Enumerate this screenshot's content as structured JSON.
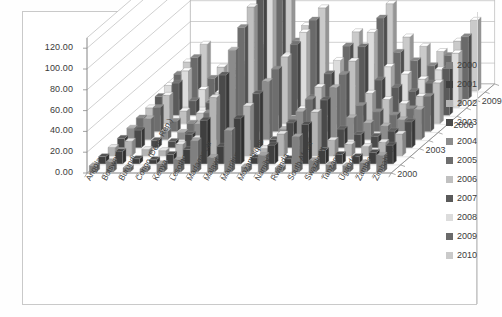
{
  "frame": {
    "border_color": "#c9c9c9",
    "background": "#ffffff"
  },
  "axes": {
    "y_ticks": [
      "120.00",
      "100.00",
      "80.00",
      "60.00",
      "40.00",
      "20.00",
      "0.00"
    ],
    "depth_ticks": [
      "2009",
      "2006",
      "2003",
      "2000"
    ]
  },
  "legend": {
    "position": "right",
    "entries": [
      {
        "label": "2000",
        "color": "#808080"
      },
      {
        "label": "2001",
        "color": "#3f3f3f"
      },
      {
        "label": "2002",
        "color": "#b4b4b4"
      },
      {
        "label": "2003",
        "color": "#4a4a4a"
      },
      {
        "label": "2004",
        "color": "#8c8c8c"
      },
      {
        "label": "2005",
        "color": "#6e6e6e"
      },
      {
        "label": "2006",
        "color": "#c0c0c0"
      },
      {
        "label": "2007",
        "color": "#5a5a5a"
      },
      {
        "label": "2008",
        "color": "#dcdcdc"
      },
      {
        "label": "2009",
        "color": "#6a6a6a"
      },
      {
        "label": "2010",
        "color": "#cacaca"
      }
    ]
  },
  "chart_data": {
    "type": "bar",
    "title": "",
    "subtitle": "",
    "xlabel": "",
    "ylabel": "",
    "zlabel": "",
    "render": "3d-grouped-bar",
    "grid": true,
    "ylim": [
      0,
      120
    ],
    "ytick_step": 20,
    "categories": [
      "Angola",
      "Botswana",
      "Burundi",
      "Congo (Dem. Rep.)",
      "Kenya",
      "Lesotho",
      "Madagascar",
      "Malawi",
      "Mauritius",
      "Mozambique",
      "Namibia",
      "Rwanda",
      "South Africa",
      "Swaziland",
      "Tanzania",
      "Uganda",
      "Zambia",
      "Zimbabwe"
    ],
    "depth_axis": [
      "2000",
      "2003",
      "2006",
      "2009"
    ],
    "series": [
      {
        "name": "2000",
        "values": [
          6,
          10,
          4,
          3,
          8,
          12,
          30,
          14,
          40,
          5,
          16,
          4,
          34,
          11,
          7,
          6,
          9,
          16
        ]
      },
      {
        "name": "2001",
        "values": [
          7,
          12,
          5,
          4,
          9,
          14,
          42,
          17,
          44,
          6,
          18,
          5,
          38,
          13,
          9,
          7,
          11,
          18
        ]
      },
      {
        "name": "2002",
        "values": [
          8,
          14,
          6,
          5,
          11,
          17,
          56,
          20,
          48,
          7,
          21,
          6,
          42,
          15,
          11,
          9,
          13,
          21
        ]
      },
      {
        "name": "2003",
        "values": [
          9,
          17,
          7,
          6,
          13,
          20,
          70,
          24,
          52,
          8,
          24,
          7,
          46,
          18,
          13,
          11,
          16,
          25
        ]
      },
      {
        "name": "2004",
        "values": [
          11,
          20,
          8,
          7,
          15,
          24,
          86,
          28,
          56,
          10,
          27,
          9,
          50,
          21,
          16,
          13,
          19,
          29
        ]
      },
      {
        "name": "2005",
        "values": [
          13,
          23,
          10,
          8,
          18,
          28,
          100,
          33,
          60,
          12,
          31,
          11,
          55,
          25,
          19,
          16,
          22,
          34
        ]
      },
      {
        "name": "2006",
        "values": [
          15,
          27,
          12,
          10,
          21,
          33,
          112,
          38,
          64,
          14,
          35,
          13,
          60,
          29,
          23,
          19,
          26,
          39
        ]
      },
      {
        "name": "2007",
        "values": [
          18,
          31,
          14,
          12,
          25,
          38,
          124,
          44,
          68,
          17,
          40,
          16,
          66,
          34,
          27,
          23,
          31,
          45
        ]
      },
      {
        "name": "2008",
        "values": [
          21,
          35,
          17,
          14,
          29,
          44,
          120,
          50,
          72,
          20,
          45,
          19,
          72,
          39,
          32,
          27,
          36,
          52
        ]
      },
      {
        "name": "2009",
        "values": [
          24,
          40,
          20,
          17,
          34,
          50,
          116,
          56,
          76,
          23,
          51,
          22,
          78,
          45,
          37,
          32,
          42,
          60
        ]
      },
      {
        "name": "2010",
        "values": [
          28,
          45,
          23,
          20,
          39,
          57,
          118,
          63,
          80,
          27,
          57,
          26,
          84,
          52,
          43,
          38,
          48,
          68
        ]
      }
    ]
  }
}
